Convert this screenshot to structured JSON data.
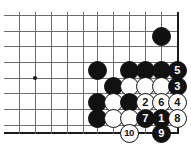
{
  "figure": {
    "kind": "go-board-diagram",
    "width": 191,
    "height": 150,
    "background_color": "#ffffff",
    "line_color": "#6b6b6b",
    "edge_color": "#1a1a1a",
    "black_stone_color": "#111111",
    "white_stone_color": "#ffffff",
    "black_number_color": "#ffffff",
    "white_number_color": "#111111"
  },
  "board": {
    "grid_spacing_px": 16,
    "stone_diameter_px": 19,
    "vertical_lines_x": [
      19,
      35,
      51,
      67,
      83,
      97,
      113,
      129,
      145,
      161,
      177
    ],
    "horizontal_lines_y": [
      15,
      31,
      46,
      62,
      78,
      93,
      109,
      125
    ],
    "right_edge_x": 177,
    "bottom_edge_y": 132,
    "star_points": [
      {
        "name": "hoshi-left",
        "x": 35,
        "y": 78
      }
    ]
  },
  "stones": [
    {
      "name": "black-stone-upper-right",
      "color": "black",
      "x": 161,
      "y": 36,
      "label": ""
    },
    {
      "name": "black-stone-left-wall",
      "color": "black",
      "x": 97,
      "y": 70,
      "label": ""
    },
    {
      "name": "black-stone-top-a",
      "color": "black",
      "x": 129,
      "y": 70,
      "label": ""
    },
    {
      "name": "black-stone-top-b",
      "color": "black",
      "x": 145,
      "y": 70,
      "label": ""
    },
    {
      "name": "black-stone-top-c",
      "color": "black",
      "x": 161,
      "y": 70,
      "label": ""
    },
    {
      "name": "black-stone-move-5",
      "color": "black",
      "x": 177,
      "y": 70,
      "label": "5"
    },
    {
      "name": "black-stone-knight",
      "color": "black",
      "x": 113,
      "y": 86,
      "label": ""
    },
    {
      "name": "white-stone-row2-a",
      "color": "white",
      "x": 129,
      "y": 86,
      "label": ""
    },
    {
      "name": "white-stone-row2-b",
      "color": "white",
      "x": 145,
      "y": 86,
      "label": ""
    },
    {
      "name": "white-stone-row2-c",
      "color": "white",
      "x": 161,
      "y": 86,
      "label": ""
    },
    {
      "name": "black-stone-move-3",
      "color": "black",
      "x": 177,
      "y": 86,
      "label": "3"
    },
    {
      "name": "black-stone-left-b",
      "color": "black",
      "x": 97,
      "y": 102,
      "label": ""
    },
    {
      "name": "white-stone-row3-a",
      "color": "white",
      "x": 113,
      "y": 102,
      "label": ""
    },
    {
      "name": "black-stone-row3-b",
      "color": "black",
      "x": 129,
      "y": 102,
      "label": ""
    },
    {
      "name": "white-stone-move-2",
      "color": "white",
      "x": 145,
      "y": 102,
      "label": "2"
    },
    {
      "name": "white-stone-move-6",
      "color": "white",
      "x": 161,
      "y": 102,
      "label": "6"
    },
    {
      "name": "white-stone-move-4",
      "color": "white",
      "x": 177,
      "y": 102,
      "label": "4"
    },
    {
      "name": "black-stone-left-c",
      "color": "black",
      "x": 97,
      "y": 118,
      "label": ""
    },
    {
      "name": "white-stone-row4-a",
      "color": "white",
      "x": 113,
      "y": 118,
      "label": ""
    },
    {
      "name": "white-stone-row4-b",
      "color": "white",
      "x": 129,
      "y": 118,
      "label": ""
    },
    {
      "name": "black-stone-move-7",
      "color": "black",
      "x": 145,
      "y": 118,
      "label": "7"
    },
    {
      "name": "black-stone-move-1",
      "color": "black",
      "x": 161,
      "y": 118,
      "label": "1"
    },
    {
      "name": "white-stone-move-8",
      "color": "white",
      "x": 177,
      "y": 118,
      "label": "8"
    },
    {
      "name": "white-stone-move-10",
      "color": "white",
      "x": 129,
      "y": 133,
      "label": "10"
    },
    {
      "name": "black-stone-move-9",
      "color": "black",
      "x": 161,
      "y": 133,
      "label": "9"
    }
  ]
}
